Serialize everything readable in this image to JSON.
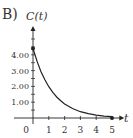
{
  "problem_label": "B)",
  "chart_data": {
    "type": "line",
    "title": "",
    "xlabel": "t",
    "ylabel": "C(t)",
    "xlim": [
      0,
      5.4
    ],
    "ylim": [
      0,
      5.2
    ],
    "x_ticks": [
      0,
      1,
      2,
      3,
      4,
      5
    ],
    "x_tick_labels": [
      "0",
      "1",
      "2",
      "3",
      "4",
      "5"
    ],
    "y_ticks": [
      1,
      2,
      3,
      4
    ],
    "y_tick_labels": [
      "1.00",
      "2.00",
      "3.00",
      "4.00"
    ],
    "y_minor_step": 0.5,
    "grid": false,
    "series": [
      {
        "name": "C(t)",
        "x": [
          0,
          0.25,
          0.5,
          0.75,
          1,
          1.25,
          1.5,
          1.75,
          2,
          2.5,
          3,
          3.5,
          4,
          4.5,
          5
        ],
        "values": [
          4.4,
          3.6,
          2.95,
          2.42,
          1.98,
          1.62,
          1.33,
          1.09,
          0.89,
          0.6,
          0.4,
          0.27,
          0.18,
          0.12,
          0.08
        ],
        "endpoints": [
          {
            "x": 0,
            "y": 4.4
          },
          {
            "x": 5,
            "y": 0.0
          }
        ]
      }
    ]
  }
}
